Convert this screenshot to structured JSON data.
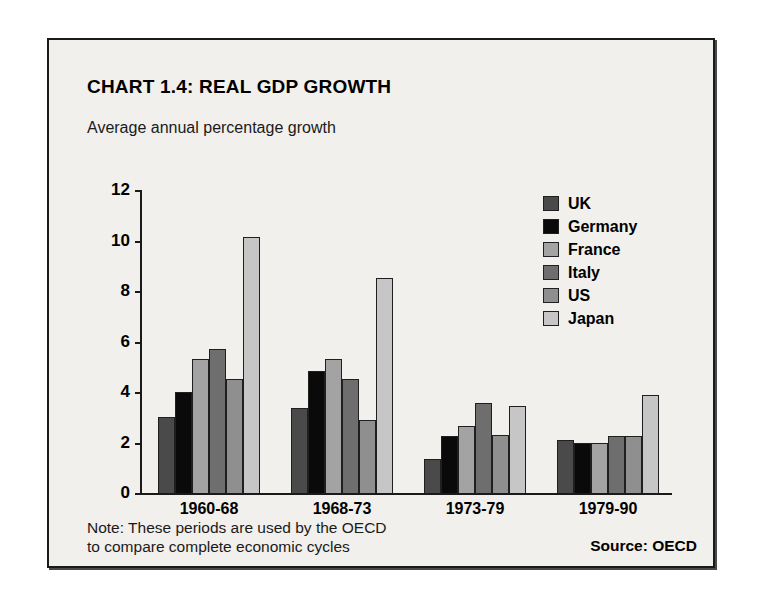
{
  "chart_data": {
    "type": "bar",
    "title": "CHART 1.4: REAL GDP GROWTH",
    "subtitle": "Average annual percentage growth",
    "ylabel": "",
    "xlabel": "",
    "ylim": [
      0,
      12
    ],
    "yticks": [
      0,
      2,
      4,
      6,
      8,
      10,
      12
    ],
    "grid": false,
    "legend_position": "top-right",
    "categories": [
      "1960-68",
      "1968-73",
      "1973-79",
      "1979-90"
    ],
    "series": [
      {
        "name": "UK",
        "color": "#4a4a4a",
        "values": [
          3.0,
          3.35,
          1.35,
          2.1
        ]
      },
      {
        "name": "Germany",
        "color": "#0a0a0a",
        "values": [
          4.0,
          4.85,
          2.25,
          2.0
        ]
      },
      {
        "name": "France",
        "color": "#a3a3a3",
        "values": [
          5.3,
          5.3,
          2.65,
          2.0
        ]
      },
      {
        "name": "Italy",
        "color": "#6e6e6e",
        "values": [
          5.7,
          4.5,
          3.55,
          2.25
        ]
      },
      {
        "name": "US",
        "color": "#8f8f8f",
        "values": [
          4.5,
          2.9,
          2.3,
          2.25
        ]
      },
      {
        "name": "Japan",
        "color": "#c6c6c6",
        "values": [
          10.15,
          8.5,
          3.45,
          3.9
        ]
      }
    ],
    "note": "Note: These periods are used by the OECD to compare complete economic cycles",
    "note_line_1": "Note: These periods are used by the OECD",
    "note_line_2": "to compare complete economic cycles",
    "source": "Source: OECD"
  },
  "panel": {
    "background_color": "#f1f0ed",
    "border_color": "#1a1a1a"
  }
}
